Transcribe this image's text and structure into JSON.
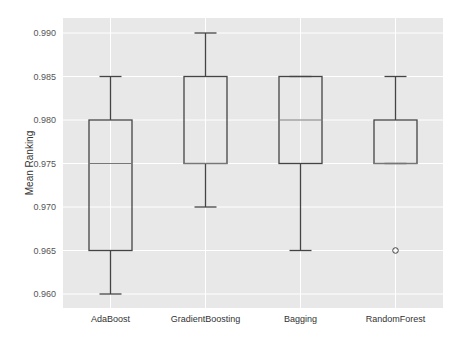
{
  "chart_data": {
    "type": "box",
    "title": "",
    "xlabel": "",
    "ylabel": "Mean Ranking",
    "ylim": [
      0.9588,
      0.9918
    ],
    "yticks": [
      0.96,
      0.965,
      0.97,
      0.975,
      0.98,
      0.985,
      0.99
    ],
    "ytick_labels": [
      "0.960",
      "0.965",
      "0.970",
      "0.975",
      "0.980",
      "0.985",
      "0.990"
    ],
    "grid": true,
    "legend": null,
    "categories": [
      "AdaBoost",
      "GradientBoosting",
      "Bagging",
      "RandomForest"
    ],
    "boxes": [
      {
        "label": "AdaBoost",
        "whislo": 0.96,
        "q1": 0.965,
        "med": 0.975,
        "q3": 0.98,
        "whishi": 0.985,
        "fliers": []
      },
      {
        "label": "GradientBoosting",
        "whislo": 0.97,
        "q1": 0.975,
        "med": 0.975,
        "q3": 0.985,
        "whishi": 0.99,
        "fliers": []
      },
      {
        "label": "Bagging",
        "whislo": 0.965,
        "q1": 0.975,
        "med": 0.98,
        "q3": 0.985,
        "whishi": 0.985,
        "fliers": []
      },
      {
        "label": "RandomForest",
        "whislo": 0.975,
        "q1": 0.975,
        "med": 0.975,
        "q3": 0.98,
        "whishi": 0.985,
        "fliers": [
          0.965
        ]
      }
    ],
    "colors": {
      "background": "#e8e8e8",
      "grid": "#ffffff",
      "box_edge": "#444444",
      "median": "#777777"
    }
  }
}
